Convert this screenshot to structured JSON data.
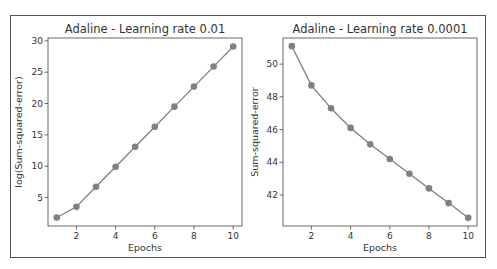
{
  "figure": {
    "border_color": "#555555",
    "line_color": "#808080",
    "marker_color": "#808080"
  },
  "chart_data": [
    {
      "type": "line",
      "title": "Adaline - Learning rate 0.01",
      "xlabel": "Epochs",
      "ylabel": "log(Sum-squared-error)",
      "x": [
        1,
        2,
        3,
        4,
        5,
        6,
        7,
        8,
        9,
        10
      ],
      "values": [
        1.8,
        3.5,
        6.7,
        9.9,
        13.1,
        16.3,
        19.5,
        22.7,
        25.9,
        29.1
      ],
      "xticks": [
        2,
        4,
        6,
        8,
        10
      ],
      "yticks": [
        5,
        10,
        15,
        20,
        25,
        30
      ],
      "xlim": [
        0.55,
        10.45
      ],
      "ylim": [
        0.44,
        30.46
      ],
      "marker": "o",
      "grid": false
    },
    {
      "type": "line",
      "title": "Adaline - Learning rate 0.0001",
      "xlabel": "Epochs",
      "ylabel": "Sum-squared-error",
      "x": [
        1,
        2,
        3,
        4,
        5,
        6,
        7,
        8,
        9,
        10
      ],
      "values": [
        51.1,
        48.7,
        47.3,
        46.1,
        45.1,
        44.2,
        43.3,
        42.4,
        41.5,
        40.6
      ],
      "xticks": [
        2,
        4,
        6,
        8,
        10
      ],
      "yticks": [
        42,
        44,
        46,
        48,
        50
      ],
      "xlim": [
        0.55,
        10.45
      ],
      "ylim": [
        40.1,
        51.6
      ],
      "marker": "o",
      "grid": false
    }
  ],
  "labels": {
    "left_title": "Adaline - Learning rate 0.01",
    "right_title": "Adaline - Learning rate 0.0001",
    "left_xlabel": "Epochs",
    "right_xlabel": "Epochs",
    "left_ylabel": "log(Sum-squared-error)",
    "right_ylabel": "Sum-squared-error"
  }
}
